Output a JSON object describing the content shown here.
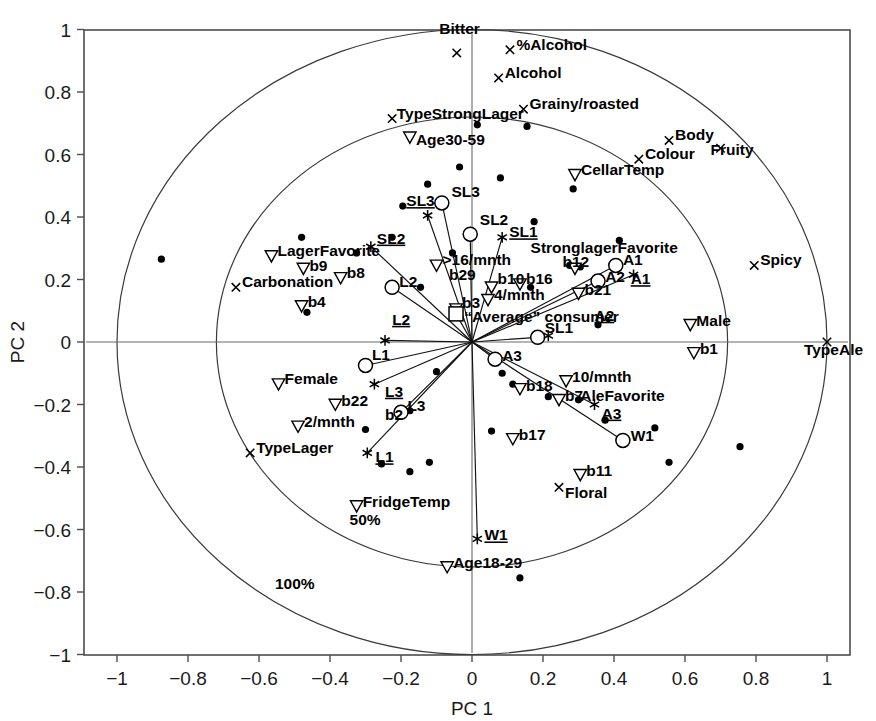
{
  "chart_data": {
    "type": "scatter",
    "title": "",
    "xlabel": "PC 1",
    "ylabel": "PC 2",
    "xlim": [
      -1.09,
      1.065
    ],
    "ylim": [
      -1.09,
      1.065
    ],
    "xticks": [
      -1,
      -0.8,
      -0.6,
      -0.4,
      -0.2,
      0,
      0.2,
      0.4,
      0.6,
      0.8,
      1
    ],
    "xticklabels": [
      "−1",
      "−0.8",
      "−0.6",
      "−0.4",
      "−0.2",
      "0",
      "0.2",
      "0.4",
      "0.6",
      "0.8",
      "1"
    ],
    "yticks": [
      -1,
      -0.8,
      -0.6,
      -0.4,
      -0.2,
      0,
      0.2,
      0.4,
      0.6,
      0.8,
      1
    ],
    "yticklabels": [
      "−1",
      "−0.8",
      "−0.6",
      "−0.4",
      "−0.2",
      "0",
      "0.2",
      "0.4",
      "0.6",
      "0.8",
      "1"
    ],
    "grid": false,
    "legend": "none",
    "circles": [
      {
        "label": "50%",
        "r": 0.72,
        "label_x": -0.345,
        "label_y": -0.585
      },
      {
        "label": "100%",
        "r": 1.0,
        "label_x": -0.555,
        "label_y": -0.79
      }
    ],
    "series": [
      {
        "name": "attributes",
        "marker": "cross",
        "points": [
          {
            "label": "Bitter",
            "x": -0.043,
            "y": 0.925,
            "lx": -0.035,
            "ly": 0.985,
            "anchor": "middle"
          },
          {
            "label": "%Alcohol",
            "x": 0.107,
            "y": 0.935,
            "lx": 0.125,
            "ly": 0.935,
            "anchor": "start"
          },
          {
            "label": "Alcohol",
            "x": 0.075,
            "y": 0.845,
            "lx": 0.092,
            "ly": 0.845,
            "anchor": "start"
          },
          {
            "label": "Grainy/roasted",
            "x": 0.145,
            "y": 0.745,
            "lx": 0.162,
            "ly": 0.745,
            "anchor": "start"
          },
          {
            "label": "TypeStrongLager",
            "x": -0.225,
            "y": 0.715,
            "lx": -0.212,
            "ly": 0.715,
            "anchor": "start"
          },
          {
            "label": "Body",
            "x": 0.555,
            "y": 0.645,
            "lx": 0.572,
            "ly": 0.645,
            "anchor": "start"
          },
          {
            "label": "Colour",
            "x": 0.47,
            "y": 0.585,
            "lx": 0.487,
            "ly": 0.585,
            "anchor": "start"
          },
          {
            "label": "Fruity",
            "x": 0.7,
            "y": 0.62,
            "lx": 0.672,
            "ly": 0.598,
            "anchor": "start"
          },
          {
            "label": "Spicy",
            "x": 0.795,
            "y": 0.245,
            "lx": 0.812,
            "ly": 0.245,
            "anchor": "start"
          },
          {
            "label": "TypeAle",
            "x": 1.0,
            "y": 0.0,
            "lx": 0.935,
            "ly": -0.043,
            "anchor": "start"
          },
          {
            "label": "Carbonation",
            "x": -0.665,
            "y": 0.175,
            "lx": -0.648,
            "ly": 0.175,
            "anchor": "start"
          },
          {
            "label": "TypeLager",
            "x": -0.625,
            "y": -0.355,
            "lx": -0.608,
            "ly": -0.355,
            "anchor": "start"
          },
          {
            "label": "Floral",
            "x": 0.245,
            "y": -0.465,
            "lx": 0.262,
            "ly": -0.5,
            "anchor": "start"
          }
        ]
      },
      {
        "name": "demographics",
        "marker": "triangle-down",
        "points": [
          {
            "label": "Age30-59",
            "x": -0.175,
            "y": 0.655,
            "lx": -0.158,
            "ly": 0.632,
            "anchor": "start"
          },
          {
            "label": "CellarTemp",
            "x": 0.29,
            "y": 0.535,
            "lx": 0.307,
            "ly": 0.535,
            "anchor": "start"
          },
          {
            "label": "LagerFavorite",
            "x": -0.565,
            "y": 0.275,
            "lx": -0.548,
            "ly": 0.275,
            "anchor": "start"
          },
          {
            "label": "b9",
            "x": -0.475,
            "y": 0.235,
            "lx": -0.458,
            "ly": 0.228,
            "anchor": "start"
          },
          {
            "label": "b4",
            "x": -0.48,
            "y": 0.115,
            "lx": -0.463,
            "ly": 0.112,
            "anchor": "start"
          },
          {
            "label": "b8",
            "x": -0.37,
            "y": 0.205,
            "lx": -0.353,
            "ly": 0.205,
            "anchor": "start"
          },
          {
            "label": "Female",
            "x": -0.545,
            "y": -0.135,
            "lx": -0.528,
            "ly": -0.135,
            "anchor": "start"
          },
          {
            "label": "b22",
            "x": -0.385,
            "y": -0.2,
            "lx": -0.368,
            "ly": -0.205,
            "anchor": "start"
          },
          {
            "label": "2/mnth",
            "x": -0.49,
            "y": -0.27,
            "lx": -0.473,
            "ly": -0.272,
            "anchor": "start"
          },
          {
            "label": "FridgeTemp",
            "x": -0.325,
            "y": -0.525,
            "lx": -0.308,
            "ly": -0.527,
            "anchor": "start"
          },
          {
            "label": "Age18-29",
            "x": -0.07,
            "y": -0.72,
            "lx": -0.053,
            "ly": -0.722,
            "anchor": "start"
          },
          {
            "label": ">16/mnth",
            "x": -0.1,
            "y": 0.245,
            "lx": -0.083,
            "ly": 0.245,
            "anchor": "start"
          },
          {
            "label": "b10",
            "x": 0.055,
            "y": 0.175,
            "lx": 0.072,
            "ly": 0.185,
            "anchor": "start"
          },
          {
            "label": "b16",
            "x": 0.135,
            "y": 0.185,
            "lx": 0.152,
            "ly": 0.185,
            "anchor": "start"
          },
          {
            "label": "4/mnth",
            "x": 0.045,
            "y": 0.135,
            "lx": 0.062,
            "ly": 0.135,
            "anchor": "start"
          },
          {
            "label": "b12",
            "x": 0.29,
            "y": 0.235,
            "lx": 0.255,
            "ly": 0.24,
            "anchor": "start"
          },
          {
            "label": "b21",
            "x": 0.3,
            "y": 0.155,
            "lx": 0.317,
            "ly": 0.152,
            "anchor": "start"
          },
          {
            "label": "Male",
            "x": 0.615,
            "y": 0.055,
            "lx": 0.632,
            "ly": 0.052,
            "anchor": "start"
          },
          {
            "label": "b1",
            "x": 0.625,
            "y": -0.035,
            "lx": 0.642,
            "ly": -0.038,
            "anchor": "start"
          },
          {
            "label": "b18",
            "x": 0.135,
            "y": -0.15,
            "lx": 0.152,
            "ly": -0.157,
            "anchor": "start"
          },
          {
            "label": "10/mnth",
            "x": 0.265,
            "y": -0.125,
            "lx": 0.282,
            "ly": -0.128,
            "anchor": "start"
          },
          {
            "label": "b7",
            "x": 0.245,
            "y": -0.185,
            "lx": 0.262,
            "ly": -0.188,
            "anchor": "start"
          },
          {
            "label": "b17",
            "x": 0.115,
            "y": -0.31,
            "lx": 0.132,
            "ly": -0.313,
            "anchor": "start"
          },
          {
            "label": "b11",
            "x": 0.305,
            "y": -0.425,
            "lx": 0.322,
            "ly": -0.428,
            "anchor": "start"
          },
          {
            "label": "b3",
            "x": -0.045,
            "y": 0.105,
            "lx": -0.028,
            "ly": 0.108,
            "anchor": "start"
          }
        ]
      },
      {
        "name": "dots",
        "marker": "dot",
        "points": [
          {
            "x": -0.875,
            "y": 0.265
          },
          {
            "x": -0.48,
            "y": 0.335
          },
          {
            "x": -0.465,
            "y": 0.095
          },
          {
            "x": -0.325,
            "y": 0.285
          },
          {
            "x": -0.125,
            "y": 0.505
          },
          {
            "x": -0.035,
            "y": 0.56
          },
          {
            "x": 0.08,
            "y": 0.525
          },
          {
            "x": 0.015,
            "y": 0.695
          },
          {
            "x": 0.155,
            "y": 0.69
          },
          {
            "x": -0.195,
            "y": 0.435
          },
          {
            "x": -0.225,
            "y": 0.335
          },
          {
            "x": 0.285,
            "y": 0.49
          },
          {
            "x": 0.175,
            "y": 0.385
          },
          {
            "x": -0.145,
            "y": 0.175
          },
          {
            "x": 0.275,
            "y": 0.245
          },
          {
            "x": 0.415,
            "y": 0.325
          },
          {
            "x": -0.1,
            "y": -0.095
          },
          {
            "x": -0.175,
            "y": -0.22
          },
          {
            "x": -0.3,
            "y": -0.28
          },
          {
            "x": -0.255,
            "y": -0.39
          },
          {
            "x": -0.175,
            "y": -0.415
          },
          {
            "x": -0.12,
            "y": -0.385
          },
          {
            "x": 0.085,
            "y": -0.1
          },
          {
            "x": 0.115,
            "y": -0.135
          },
          {
            "x": 0.055,
            "y": -0.285
          },
          {
            "x": 0.215,
            "y": -0.175
          },
          {
            "x": 0.3,
            "y": -0.185
          },
          {
            "x": 0.375,
            "y": -0.25
          },
          {
            "x": 0.515,
            "y": -0.275
          },
          {
            "x": 0.555,
            "y": -0.385
          },
          {
            "x": 0.755,
            "y": -0.335
          },
          {
            "x": 0.135,
            "y": -0.755
          },
          {
            "x": -0.055,
            "y": 0.285
          },
          {
            "x": 0.165,
            "y": 0.175
          },
          {
            "x": 0.305,
            "y": 0.24
          },
          {
            "x": 0.355,
            "y": 0.055
          }
        ]
      },
      {
        "name": "segment-scores-circle",
        "marker": "open-circle",
        "points": [
          {
            "label": "SL3",
            "x": -0.085,
            "y": 0.445,
            "lx": -0.058,
            "ly": 0.465,
            "anchor": "start"
          },
          {
            "label": "SL2",
            "x": -0.005,
            "y": 0.345,
            "lx": 0.022,
            "ly": 0.375,
            "anchor": "start"
          },
          {
            "label": "SL1",
            "x": 0.185,
            "y": 0.015,
            "lx": 0.205,
            "ly": 0.028,
            "anchor": "start"
          },
          {
            "label": "L2",
            "x": -0.225,
            "y": 0.175,
            "lx": -0.205,
            "ly": 0.175,
            "anchor": "start"
          },
          {
            "label": "L1",
            "x": -0.3,
            "y": -0.075,
            "lx": -0.282,
            "ly": -0.058,
            "anchor": "start"
          },
          {
            "label": "L3",
            "x": -0.2,
            "y": -0.225,
            "lx": -0.182,
            "ly": -0.222,
            "anchor": "start"
          },
          {
            "label": "A1",
            "x": 0.405,
            "y": 0.245,
            "lx": 0.425,
            "ly": 0.245,
            "anchor": "start"
          },
          {
            "label": "A2",
            "x": 0.355,
            "y": 0.195,
            "lx": 0.375,
            "ly": 0.192,
            "anchor": "start"
          },
          {
            "label": "A3",
            "x": 0.065,
            "y": -0.055,
            "lx": 0.085,
            "ly": -0.062,
            "anchor": "start"
          },
          {
            "label": "W1",
            "x": 0.425,
            "y": -0.315,
            "lx": 0.447,
            "ly": -0.318,
            "anchor": "start"
          }
        ]
      },
      {
        "name": "segment-vectors-star",
        "marker": "star",
        "points": [
          {
            "label": "SL3",
            "x": -0.125,
            "y": 0.405,
            "lx": -0.185,
            "ly": 0.435,
            "anchor": "start"
          },
          {
            "label": "SL2",
            "x": -0.285,
            "y": 0.305,
            "lx": -0.268,
            "ly": 0.315,
            "anchor": "start"
          },
          {
            "label": "SL1",
            "x": 0.085,
            "y": 0.335,
            "lx": 0.105,
            "ly": 0.335,
            "anchor": "start"
          },
          {
            "label": "L2",
            "x": -0.245,
            "y": 0.005,
            "lx": -0.225,
            "ly": 0.055,
            "anchor": "start"
          },
          {
            "label": "L1",
            "x": -0.295,
            "y": -0.355,
            "lx": -0.272,
            "ly": -0.385,
            "anchor": "start"
          },
          {
            "label": "L3",
            "x": -0.275,
            "y": -0.135,
            "lx": -0.245,
            "ly": -0.175,
            "anchor": "start"
          },
          {
            "label": "A1",
            "x": 0.455,
            "y": 0.215,
            "lx": 0.447,
            "ly": 0.185,
            "anchor": "start"
          },
          {
            "label": "A2",
            "x": 0.215,
            "y": 0.02,
            "lx": 0.345,
            "ly": 0.068,
            "anchor": "start"
          },
          {
            "label": "A3",
            "x": 0.345,
            "y": -0.2,
            "lx": 0.365,
            "ly": -0.245,
            "anchor": "start"
          },
          {
            "label": "W1",
            "x": 0.015,
            "y": -0.63,
            "lx": 0.035,
            "ly": -0.635,
            "anchor": "start"
          }
        ]
      },
      {
        "name": "average-consumer",
        "marker": "square",
        "points": [
          {
            "label": "“Average” consumer",
            "x": -0.045,
            "y": 0.09,
            "lx": -0.022,
            "ly": 0.065,
            "anchor": "start"
          }
        ]
      },
      {
        "name": "favorite-attributes",
        "marker": "text-only",
        "points": [
          {
            "label": "StronglagerFavorite",
            "x": 0.165,
            "y": 0.275,
            "lx": 0.165,
            "ly": 0.285,
            "anchor": "start"
          },
          {
            "label": "AleFavorite",
            "x": 0.295,
            "y": -0.185,
            "lx": 0.305,
            "ly": -0.19,
            "anchor": "start"
          },
          {
            "label": "b29",
            "x": -0.065,
            "y": 0.195,
            "lx": -0.065,
            "ly": 0.198,
            "anchor": "start"
          },
          {
            "label": "b2",
            "x": -0.245,
            "y": -0.245,
            "lx": -0.245,
            "ly": -0.248,
            "anchor": "start"
          }
        ]
      }
    ],
    "vectors_from_origin": [
      {
        "label": "SL3",
        "x": -0.125,
        "y": 0.405
      },
      {
        "label": "SL3b",
        "x": -0.085,
        "y": 0.445
      },
      {
        "label": "SL2",
        "x": -0.285,
        "y": 0.305
      },
      {
        "label": "SL2b",
        "x": -0.005,
        "y": 0.345
      },
      {
        "label": "SL1",
        "x": 0.085,
        "y": 0.335
      },
      {
        "label": "SL1b",
        "x": 0.185,
        "y": 0.015
      },
      {
        "label": "L2",
        "x": -0.245,
        "y": 0.005
      },
      {
        "label": "L2b",
        "x": -0.225,
        "y": 0.175
      },
      {
        "label": "L1",
        "x": -0.295,
        "y": -0.355
      },
      {
        "label": "L1b",
        "x": -0.3,
        "y": -0.075
      },
      {
        "label": "L3",
        "x": -0.275,
        "y": -0.135
      },
      {
        "label": "L3b",
        "x": -0.2,
        "y": -0.225
      },
      {
        "label": "A1",
        "x": 0.455,
        "y": 0.215
      },
      {
        "label": "A1b",
        "x": 0.405,
        "y": 0.245
      },
      {
        "label": "A2",
        "x": 0.355,
        "y": 0.195
      },
      {
        "label": "A3",
        "x": 0.345,
        "y": -0.2
      },
      {
        "label": "A3b",
        "x": 0.065,
        "y": -0.055
      },
      {
        "label": "W1",
        "x": 0.015,
        "y": -0.63
      },
      {
        "label": "W1b",
        "x": 0.425,
        "y": -0.315
      },
      {
        "label": "avg",
        "x": -0.045,
        "y": 0.09
      }
    ]
  }
}
